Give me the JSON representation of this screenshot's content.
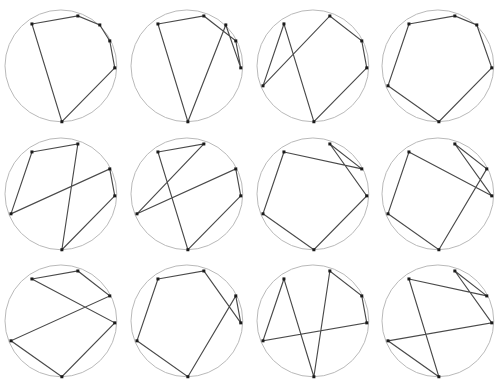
{
  "caption": "",
  "figure": {
    "rows": 3,
    "columns": 4,
    "panel_count": 12,
    "circle_color": "#b9b9b9",
    "polygon_color": "#4a4a4a",
    "vertex_color": "#1a1a1a",
    "background": "#ffffff"
  },
  "chart_data": {
    "type": "scatter",
    "xlabel": "",
    "ylabel": "",
    "grid": false,
    "legend": null,
    "circle": {
      "cx": 61,
      "cy": 66,
      "r": 56
    },
    "vertices": [
      {
        "id": 0,
        "label": "V0",
        "x": 78,
        "y": 16,
        "angle_deg": -63
      },
      {
        "id": 1,
        "label": "V1",
        "x": 100,
        "y": 25,
        "angle_deg": -45
      },
      {
        "id": 2,
        "label": "V2",
        "x": 110,
        "y": 41,
        "angle_deg": -27
      },
      {
        "id": 3,
        "label": "V3",
        "x": 115,
        "y": 68,
        "angle_deg": 2
      },
      {
        "id": 4,
        "label": "V4",
        "x": 62,
        "y": 122,
        "angle_deg": 88
      },
      {
        "id": 5,
        "label": "V5",
        "x": 11,
        "y": 86,
        "angle_deg": 158
      },
      {
        "id": 6,
        "label": "V6",
        "x": 32,
        "y": 24,
        "angle_deg": -122
      }
    ],
    "panels": [
      {
        "index": 1,
        "name": "panel-1",
        "cycle": [
          6,
          0,
          1,
          2,
          3,
          4
        ],
        "crossings": 0
      },
      {
        "index": 2,
        "name": "panel-2",
        "cycle": [
          6,
          0,
          2,
          3,
          1,
          4
        ],
        "crossings": 1
      },
      {
        "index": 3,
        "name": "panel-3",
        "cycle": [
          6,
          5,
          0,
          2,
          3,
          4
        ],
        "crossings": 3
      },
      {
        "index": 4,
        "name": "panel-4",
        "cycle": [
          6,
          0,
          1,
          3,
          4,
          5
        ],
        "crossings": 2
      },
      {
        "index": 5,
        "name": "panel-5",
        "cycle": [
          6,
          0,
          4,
          3,
          2,
          5
        ],
        "crossings": 3
      },
      {
        "index": 6,
        "name": "panel-6",
        "cycle": [
          6,
          0,
          5,
          2,
          3,
          4
        ],
        "crossings": 2
      },
      {
        "index": 7,
        "name": "panel-7",
        "cycle": [
          6,
          2,
          0,
          3,
          4,
          5
        ],
        "crossings": 3
      },
      {
        "index": 8,
        "name": "panel-8",
        "cycle": [
          6,
          3,
          0,
          2,
          4,
          5
        ],
        "crossings": 4
      },
      {
        "index": 9,
        "name": "panel-9",
        "cycle": [
          6,
          0,
          2,
          5,
          4,
          3
        ],
        "crossings": 3
      },
      {
        "index": 10,
        "name": "panel-10",
        "cycle": [
          6,
          0,
          3,
          2,
          4,
          5
        ],
        "crossings": 2
      },
      {
        "index": 11,
        "name": "panel-11",
        "cycle": [
          6,
          4,
          0,
          2,
          3,
          5
        ],
        "crossings": 4
      },
      {
        "index": 12,
        "name": "panel-12",
        "cycle": [
          6,
          2,
          0,
          3,
          5,
          4
        ],
        "crossings": 5
      }
    ]
  }
}
